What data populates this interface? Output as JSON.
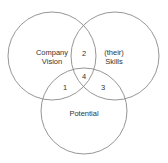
{
  "diagram": {
    "type": "venn",
    "circles": [
      {
        "id": "company-vision",
        "label_line1": "Company",
        "label_line2": "Vision",
        "cx": 52,
        "cy": 56,
        "r": 44
      },
      {
        "id": "skills",
        "label_line1": "(their)",
        "label_line2": "Skills",
        "cx": 115,
        "cy": 56,
        "r": 44
      },
      {
        "id": "potential",
        "label": "Potential",
        "cx": 84,
        "cy": 111,
        "r": 43
      }
    ],
    "regions": [
      {
        "id": "1",
        "label": "1",
        "between": [
          "company-vision",
          "potential"
        ]
      },
      {
        "id": "2",
        "label": "2",
        "between": [
          "company-vision",
          "skills"
        ]
      },
      {
        "id": "3",
        "label": "3",
        "between": [
          "skills",
          "potential"
        ]
      },
      {
        "id": "4",
        "label": "4",
        "between": [
          "company-vision",
          "skills",
          "potential"
        ]
      }
    ],
    "colors": {
      "stroke": "#8a8a8a",
      "text": "#333333",
      "background": "#ffffff"
    }
  }
}
